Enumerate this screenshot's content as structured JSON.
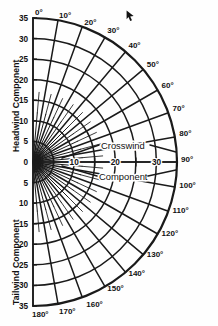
{
  "chart_data": {
    "type": "polar-nomogram",
    "annotations": [
      "Crosswind",
      "Component"
    ],
    "axis_labels": {
      "vertical_upper": "Headwind Component",
      "vertical_lower": "Tailwind Component",
      "horizontal": "Crosswind Component"
    },
    "radial_rings": [
      5,
      10,
      15,
      20,
      25,
      30,
      35
    ],
    "ring_max": 35,
    "angle_ticks_deg": [
      0,
      10,
      20,
      30,
      40,
      50,
      60,
      70,
      80,
      90,
      100,
      110,
      120,
      130,
      140,
      150,
      160,
      170,
      180
    ],
    "angle_tick_labels": [
      "0°",
      "10°",
      "20°",
      "30°",
      "40°",
      "50°",
      "60°",
      "70°",
      "80°",
      "90°",
      "100°",
      "110°",
      "120°",
      "130°",
      "140°",
      "150°",
      "160°",
      "170°",
      "180°"
    ],
    "minor_angle_step_deg": 5,
    "headwind_scale": [
      35,
      30,
      25,
      20,
      15,
      10,
      5,
      0
    ],
    "tailwind_scale": [
      0,
      5,
      10,
      15,
      20,
      25,
      30,
      35
    ],
    "crosswind_scale_labeled": [
      0,
      10,
      20,
      30
    ],
    "crosswind_scale_ticks": [
      5,
      15,
      25,
      35
    ],
    "xlim": [
      0,
      35
    ],
    "ylim": [
      -35,
      35
    ],
    "grid": true,
    "legend": "none",
    "line_color": "#1a1a1a",
    "background_color": "#ffffff"
  },
  "geometry": {
    "origin_x": 33,
    "origin_y": 162,
    "radius_px": 144
  },
  "annotations": {
    "crosswind": "Crosswind",
    "component": "Component"
  },
  "side_labels": {
    "headwind": "Headwind Component",
    "tailwind": "Tailwind Component"
  },
  "cursor": {
    "name": "arrow-pointer",
    "x": 126,
    "y": 10
  }
}
